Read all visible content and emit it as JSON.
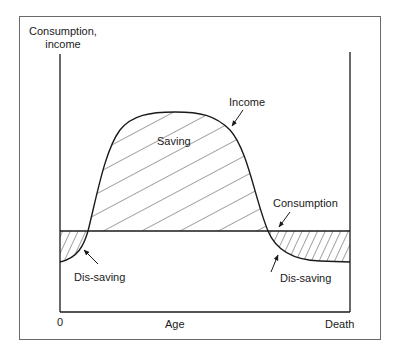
{
  "diagram": {
    "type": "life-cycle consumption/income diagram",
    "y_axis_label_line1": "Consumption,",
    "y_axis_label_line2": "income",
    "x_axis_label": "Age",
    "x_axis_start": "0",
    "x_axis_end": "Death",
    "curves": {
      "income": "Income",
      "consumption": "Consumption"
    },
    "regions": {
      "saving": "Saving",
      "dissaving_early": "Dis-saving",
      "dissaving_late": "Dis-saving"
    },
    "colors": {
      "line": "#1a1a1a",
      "frame": "#6a6a6a",
      "background": "#ffffff"
    }
  }
}
